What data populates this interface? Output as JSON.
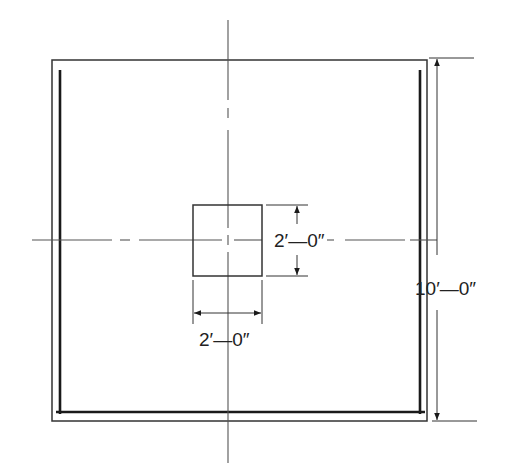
{
  "diagram": {
    "type": "plan-view-dimension-drawing",
    "colors": {
      "line": "#333333",
      "heavy": "#1a1a1a",
      "centerline": "#555555",
      "background": "#ffffff"
    },
    "overall_dimension": {
      "label": "10′—0″",
      "orientation": "vertical"
    },
    "opening_height": {
      "label": "2′—0″",
      "orientation": "vertical"
    },
    "opening_width": {
      "label": "2′—0″",
      "orientation": "horizontal"
    }
  }
}
